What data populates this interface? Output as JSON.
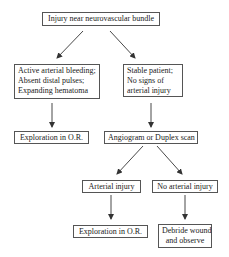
{
  "diagram": {
    "type": "flowchart",
    "line_color": "#333333",
    "nodes": {
      "root": {
        "label": "Injury near neurovascular bundle"
      },
      "unstable": {
        "lines": [
          "Active arterial bleeding;",
          "Absent distal pulses;",
          "Expanding hematoma"
        ]
      },
      "stable": {
        "lines": [
          "Stable patient;",
          "No signs of",
          "arterial injury"
        ]
      },
      "explore1": {
        "label": "Exploration in O.R."
      },
      "imaging": {
        "label": "Angiogram or Duplex scan"
      },
      "arterial": {
        "label": "Arterial injury"
      },
      "no_arterial": {
        "label": "No arterial injury"
      },
      "explore2": {
        "label": "Exploration in O.R."
      },
      "debride": {
        "lines": [
          "Debride wound",
          "and observe"
        ]
      }
    },
    "edges": [
      {
        "from": "root",
        "to": "unstable"
      },
      {
        "from": "root",
        "to": "stable"
      },
      {
        "from": "unstable",
        "to": "explore1"
      },
      {
        "from": "stable",
        "to": "imaging"
      },
      {
        "from": "imaging",
        "to": "arterial"
      },
      {
        "from": "imaging",
        "to": "no_arterial"
      },
      {
        "from": "arterial",
        "to": "explore2"
      },
      {
        "from": "no_arterial",
        "to": "debride"
      }
    ]
  }
}
